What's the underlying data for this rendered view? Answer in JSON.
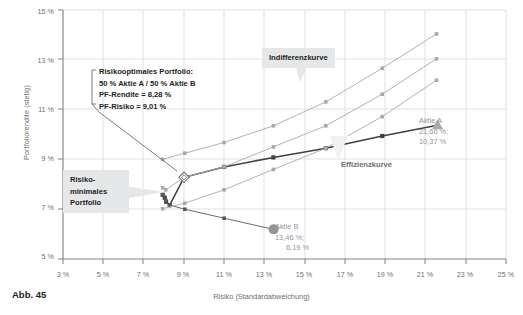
{
  "figure": {
    "number_label": "Abb. 45"
  },
  "chart_data": {
    "type": "line",
    "title": "",
    "xlabel": "Risiko (Standardabweichung)",
    "ylabel": "Portfoliorendite (stetig)",
    "xlim": [
      3,
      25
    ],
    "ylim": [
      5,
      15
    ],
    "xticks": [
      "3 %",
      "5 %",
      "7 %",
      "9 %",
      "11 %",
      "13 %",
      "15 %",
      "17 %",
      "19 %",
      "21 %",
      "23 %",
      "25 %"
    ],
    "yticks": [
      "5 %",
      "7 %",
      "9 %",
      "11 %",
      "13 %",
      "15 %"
    ],
    "xtick_values": [
      3,
      5,
      7,
      9,
      11,
      13,
      15,
      17,
      19,
      21,
      23,
      25
    ],
    "ytick_values": [
      5,
      7,
      9,
      11,
      13,
      15
    ],
    "grid": true,
    "legend_position": "none",
    "series": [
      {
        "name": "Effizienzkurve",
        "color": "#404042",
        "marker": "square",
        "points": [
          [
            7.95,
            7.58
          ],
          [
            8.05,
            7.46
          ],
          [
            8.12,
            7.3
          ],
          [
            8.3,
            7.16
          ],
          [
            9.01,
            8.28
          ],
          [
            11.0,
            8.7
          ],
          [
            13.45,
            9.08
          ],
          [
            16.05,
            9.45
          ],
          [
            18.85,
            9.94
          ],
          [
            21.6,
            10.37
          ]
        ]
      },
      {
        "name": "Untere Portfoliogrenze",
        "color": "#58595b",
        "marker": "square",
        "points": [
          [
            7.95,
            7.58
          ],
          [
            8.1,
            7.35
          ],
          [
            8.3,
            7.16
          ],
          [
            9.05,
            7.0
          ],
          [
            11.0,
            6.64
          ],
          [
            13.46,
            6.19
          ]
        ]
      },
      {
        "name": "Indifferenzkurve 1",
        "color": "#a7a9ac",
        "marker": "square",
        "points": [
          [
            7.95,
            9.0
          ],
          [
            9.05,
            9.25
          ],
          [
            11.0,
            9.68
          ],
          [
            13.45,
            10.35
          ],
          [
            16.05,
            11.31
          ],
          [
            18.85,
            12.66
          ],
          [
            21.55,
            14.04
          ]
        ]
      },
      {
        "name": "Indifferenzkurve 2",
        "color": "#a7a9ac",
        "marker": "square",
        "points": [
          [
            7.95,
            7.86
          ],
          [
            8.1,
            7.78
          ],
          [
            9.01,
            8.28
          ],
          [
            11.0,
            8.7
          ],
          [
            13.45,
            9.5
          ],
          [
            16.05,
            10.35
          ],
          [
            18.85,
            11.62
          ],
          [
            21.55,
            13.04
          ]
        ]
      },
      {
        "name": "Indifferenzkurve 3",
        "color": "#a7a9ac",
        "marker": "square",
        "points": [
          [
            7.95,
            7.02
          ],
          [
            9.05,
            7.24
          ],
          [
            11.0,
            7.78
          ],
          [
            13.45,
            8.6
          ],
          [
            16.05,
            9.45
          ],
          [
            18.85,
            10.72
          ],
          [
            21.55,
            12.18
          ]
        ]
      }
    ],
    "points_of_interest": [
      {
        "name": "Aktie A",
        "marker": "triangle",
        "color": "#a7a9ac",
        "x": 21.6,
        "y": 10.37,
        "label_title": "Aktie A",
        "label_risk": "21,60 %;",
        "label_return": "10,37 %"
      },
      {
        "name": "Aktie B",
        "marker": "circle",
        "color": "#939598",
        "x": 13.46,
        "y": 6.19,
        "label_title": "Aktie B",
        "label_risk": "13,46 %;",
        "label_return": "6,19 %"
      },
      {
        "name": "Risikooptimales Portfolio",
        "marker": "diamond-open",
        "color": "#6d6e71",
        "x": 9.01,
        "y": 8.28
      }
    ],
    "annotations": [
      {
        "id": "indifferenzkurve",
        "text": "Indifferenzkurve",
        "style": "grey-box"
      },
      {
        "id": "effizienzkurve",
        "text": "Effizienzkurve",
        "style": "plain"
      },
      {
        "id": "risikominimales-portfolio",
        "line1": "Risiko-",
        "line2": "minimales",
        "line3": "Portfolio",
        "style": "grey-box"
      },
      {
        "id": "risikooptimales-portfolio",
        "line1": "Risikooptimales Portfolio:",
        "line2": "50 % Aktie A / 50 % Aktie B",
        "line3": "PF-Rendite = 8,28 %",
        "line4": "PF-Risiko = 9,01 %",
        "style": "bracket"
      }
    ],
    "colors": {
      "efficiency_curve": "#404042",
      "indifference_curve": "#a7a9ac",
      "grid": "#d8d9da",
      "axis": "#808285",
      "callout_bg": "#e6e7e8",
      "text": "#58595b"
    }
  }
}
